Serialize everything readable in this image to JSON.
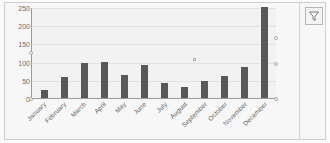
{
  "widget": {
    "type": "bar-chart-panel",
    "filter_button_title": "Filter",
    "filter_icon": "funnel-icon",
    "accent_color": "#595959",
    "plot_background": "#f2f2f2",
    "panel_background": "#f7f7f7",
    "gridline_color": "#e2e2e2",
    "axis_color": "#9a9a9a"
  },
  "chart_data": {
    "type": "bar",
    "title": "",
    "subtitle": "",
    "xlabel": "",
    "ylabel": "",
    "categories": [
      "January",
      "February",
      "March",
      "April",
      "May",
      "June",
      "July",
      "August",
      "September",
      "October",
      "November",
      "December"
    ],
    "values": [
      22,
      57,
      97,
      98,
      64,
      90,
      42,
      29,
      46,
      60,
      86,
      250
    ],
    "ylim": [
      0,
      250
    ],
    "yticks": [
      0,
      50,
      100,
      150,
      200,
      250
    ],
    "ytick_labels": [
      "0",
      "50",
      "100",
      "150",
      "200",
      "250"
    ],
    "grid": "horizontal",
    "legend": "none",
    "series": [
      {
        "name": "Series 1",
        "color": "#595959",
        "values": [
          22,
          57,
          97,
          98,
          64,
          90,
          42,
          29,
          46,
          60,
          86,
          250
        ]
      }
    ]
  }
}
